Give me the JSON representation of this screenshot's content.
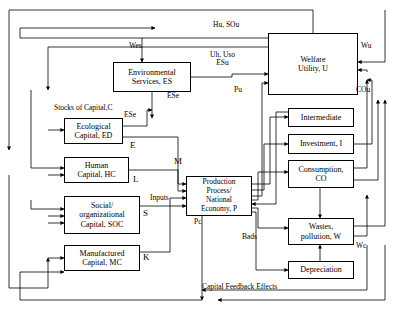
{
  "diagram": {
    "type": "flow-diagram",
    "stroke_color": "#000000",
    "background_color": "#ffffff",
    "boxes": [
      {
        "id": "environmental-services",
        "label": "Environmental\nServices, ES",
        "x": 113,
        "y": 62,
        "w": 78,
        "h": 30
      },
      {
        "id": "welfare-utility",
        "label": "Welfare\nUtility, U",
        "x": 268,
        "y": 33,
        "w": 90,
        "h": 62
      },
      {
        "id": "ecological-capital",
        "label": "Ecological\nCapital, ED",
        "x": 64,
        "y": 118,
        "w": 59,
        "h": 26
      },
      {
        "id": "human-capital",
        "label": "Human\nCapital, HC",
        "x": 64,
        "y": 157,
        "w": 65,
        "h": 26
      },
      {
        "id": "social-capital",
        "label": "Social/\norganizational\nCapital, SOC",
        "x": 64,
        "y": 196,
        "w": 76,
        "h": 38
      },
      {
        "id": "manufactured-capital",
        "label": "Manufactured\nCapital, MC",
        "x": 64,
        "y": 245,
        "w": 76,
        "h": 26
      },
      {
        "id": "production-process",
        "label": "Production\nProcess/\nNational\nEconomy, P",
        "x": 186,
        "y": 176,
        "w": 66,
        "h": 40
      },
      {
        "id": "intermediate",
        "label": "Intermediate",
        "x": 288,
        "y": 108,
        "w": 66,
        "h": 19
      },
      {
        "id": "investment",
        "label": "Investment, I",
        "x": 288,
        "y": 134,
        "w": 66,
        "h": 20
      },
      {
        "id": "consumption",
        "label": "Consumption,\nCO",
        "x": 288,
        "y": 160,
        "w": 66,
        "h": 28
      },
      {
        "id": "wastes-pollution",
        "label": "Wastes,\npollution, W",
        "x": 288,
        "y": 218,
        "w": 66,
        "h": 27
      },
      {
        "id": "depreciation",
        "label": "Depreciation",
        "x": 288,
        "y": 261,
        "w": 66,
        "h": 18
      }
    ],
    "edge_labels": [
      {
        "id": "hu-sou",
        "text": "Hu, SOu",
        "x": 213,
        "y": 21
      },
      {
        "id": "wes",
        "text": "Wes",
        "x": 129,
        "y": 48
      },
      {
        "id": "uh-uso-esu",
        "text": "Uh, Uso\nESu",
        "x": 210,
        "y": 51
      },
      {
        "id": "wu",
        "text": "Wu",
        "x": 361,
        "y": 45
      },
      {
        "id": "ese-top",
        "text": "ESe",
        "x": 167,
        "y": 94
      },
      {
        "id": "pu",
        "text": "Pu",
        "x": 234,
        "y": 88
      },
      {
        "id": "cou",
        "text": "COu",
        "x": 358,
        "y": 89
      },
      {
        "id": "stocks-of-capital",
        "text": "Stocks of Capital,C",
        "x": 54,
        "y": 105
      },
      {
        "id": "ese-left",
        "text": "ESe",
        "x": 124,
        "y": 113
      },
      {
        "id": "e-label",
        "text": "E",
        "x": 130,
        "y": 143
      },
      {
        "id": "m-label",
        "text": "M",
        "x": 175,
        "y": 160
      },
      {
        "id": "l-label",
        "text": "L",
        "x": 133,
        "y": 177
      },
      {
        "id": "inputs",
        "text": "Inputs",
        "x": 152,
        "y": 197
      },
      {
        "id": "s-label",
        "text": "S",
        "x": 143,
        "y": 211
      },
      {
        "id": "k-label",
        "text": "K",
        "x": 143,
        "y": 255
      },
      {
        "id": "pc-label",
        "text": "Pc",
        "x": 194,
        "y": 222
      },
      {
        "id": "bads",
        "text": "Bads",
        "x": 243,
        "y": 236
      },
      {
        "id": "wc-label",
        "text": "Wc",
        "x": 357,
        "y": 245
      },
      {
        "id": "capital-feedback-effects",
        "text": "Capital Feedback Effects",
        "x": 202,
        "y": 285
      }
    ]
  }
}
